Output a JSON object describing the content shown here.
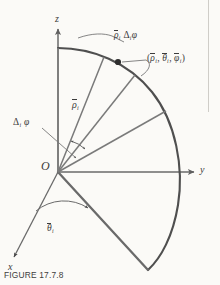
{
  "figure": {
    "caption": "FIGURE 17.7.8",
    "background_color": "#fbfaf7",
    "line_color": "#5f5f5f",
    "text_color": "#3b3b3b"
  },
  "axes": {
    "z": {
      "label": "z",
      "direction": "up"
    },
    "y": {
      "label": "y",
      "direction": "right"
    },
    "x": {
      "label": "x",
      "direction": "down-left"
    },
    "origin": {
      "label": "O"
    }
  },
  "labels": {
    "arc_length": {
      "rho_bar": "ρ",
      "sub_i": "i",
      "delta": "Δ",
      "phi": "φ"
    },
    "point_triple": {
      "open": "(",
      "rho_bar": "ρ",
      "theta_bar": "θ",
      "phi_bar": "φ",
      "sub_i": "i",
      "comma": ",",
      "close": ")"
    },
    "radius": {
      "rho_bar": "ρ",
      "sub_i": "i"
    },
    "delta_phi": {
      "delta": "Δ",
      "sub_i": "i",
      "phi": "φ"
    },
    "theta_bar": {
      "theta_bar": "θ",
      "sub_i": "i"
    }
  },
  "geometry": {
    "origin_px": [
      58,
      172
    ],
    "sphere_radius_px": 124,
    "z_axis_tip_px": [
      58,
      27
    ],
    "y_axis_tip_px": [
      196,
      172
    ],
    "x_axis_tip_px": [
      12,
      259
    ],
    "sample_point_px": [
      118,
      62
    ],
    "wedge_lower_tip_px": [
      148,
      270
    ],
    "radial_line_angles_deg": [
      90,
      68,
      52,
      36
    ],
    "theta_arc_radius_px": 44,
    "delta_phi_arc_radius_px": 34
  }
}
